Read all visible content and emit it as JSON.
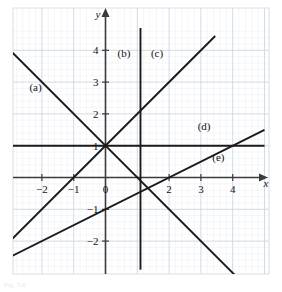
{
  "chart_data": {
    "type": "line",
    "title": "",
    "xlabel": "x",
    "ylabel": "y",
    "xlim": [
      -3.0,
      5.1
    ],
    "ylim": [
      -2.9,
      4.7
    ],
    "grid": true,
    "minor_grid": true,
    "grid_step": 0.2,
    "major_grid_step": 1,
    "legend": "inline-labels",
    "xticks": [
      -2,
      -1,
      0,
      2,
      3,
      4
    ],
    "xtick_labels": [
      "−2",
      "−1",
      "0",
      "2",
      "3",
      "4"
    ],
    "yticks": [
      -2,
      -1,
      1,
      2,
      3,
      4
    ],
    "ytick_labels": [
      "−2",
      "−1",
      "1",
      "2",
      "3",
      "4"
    ],
    "series": [
      {
        "name": "(a)",
        "equation": "y = 1 - x",
        "slope": -1,
        "intercept": 1,
        "label": "(a)",
        "label_x": -2.2,
        "label_y": 2.72,
        "x_start": -2.95,
        "x_end": 4.55
      },
      {
        "name": "(b)",
        "equation": "x = 1",
        "vertical": true,
        "x_value": 1.1,
        "label": "(b)",
        "label_x": 0.58,
        "label_y": 3.78,
        "y_start": -2.9,
        "y_end": 4.7
      },
      {
        "name": "(c)",
        "equation": "y = 1 + x",
        "slope": 1,
        "intercept": 1,
        "label": "(c)",
        "label_x": 1.62,
        "label_y": 3.78,
        "x_start": -3.0,
        "x_end": 3.45
      },
      {
        "name": "(d)",
        "equation": "y = 1",
        "slope": 0,
        "intercept": 1,
        "label": "(d)",
        "label_x": 3.1,
        "label_y": 1.48,
        "x_start": -3.0,
        "x_end": 5.0
      },
      {
        "name": "(e)",
        "equation": "y = (x - 2)/2",
        "slope": 0.5,
        "intercept": -1,
        "label": "(e)",
        "label_x": 3.55,
        "label_y": 0.52,
        "x_start": -3.0,
        "x_end": 5.0
      }
    ],
    "annotations": [
      {
        "text": "y",
        "role": "y-axis-name"
      },
      {
        "text": "x",
        "role": "x-axis-name"
      }
    ]
  },
  "style": {
    "line_color": "#1a1a1a",
    "axis_color": "#3b3b3b",
    "major_grid_color": "#c9d2dd",
    "minor_grid_color": "#e9eef4",
    "frame_color": "#d7dee6",
    "background": "#ffffff"
  },
  "caption": {
    "text": "Fig. 5.6"
  }
}
